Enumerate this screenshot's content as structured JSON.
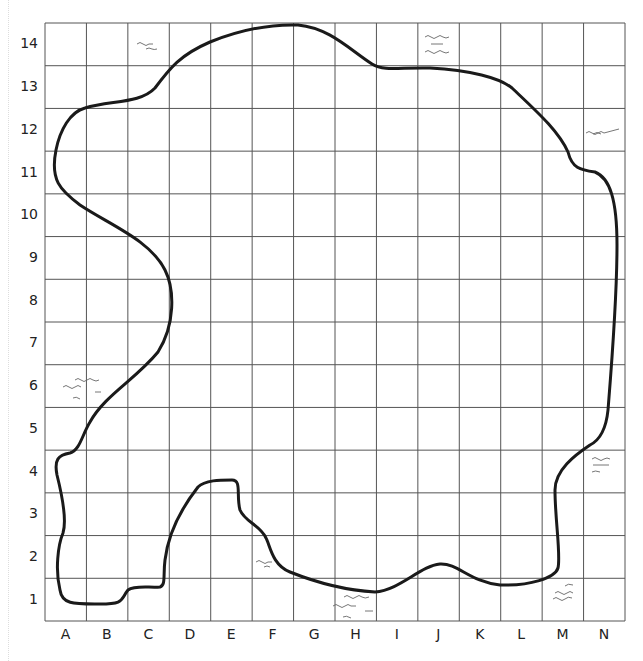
{
  "grid": {
    "columns": [
      "A",
      "B",
      "C",
      "D",
      "E",
      "F",
      "G",
      "H",
      "I",
      "J",
      "K",
      "L",
      "M",
      "N"
    ],
    "rows": [
      "14",
      "13",
      "12",
      "11",
      "10",
      "9",
      "8",
      "7",
      "6",
      "5",
      "4",
      "3",
      "2",
      "1"
    ],
    "line_color": "#555555",
    "outline_color": "#1a1a1a"
  },
  "water_marks": [
    {
      "cell": "C14"
    },
    {
      "cell": "J14"
    },
    {
      "cell": "N12"
    },
    {
      "cell": "A6"
    },
    {
      "cell": "N4"
    },
    {
      "cell": "F2"
    },
    {
      "cell": "H1"
    },
    {
      "cell": "M1"
    }
  ]
}
